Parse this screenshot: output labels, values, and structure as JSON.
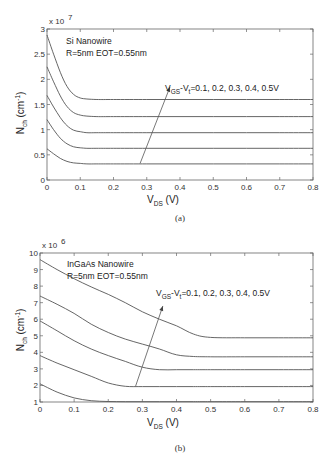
{
  "chart_data": [
    {
      "id": "a",
      "type": "line",
      "caption": "(a)",
      "annotation_title": "Si Nanowire",
      "annotation_params": "R=5nm EOT=0.55nm",
      "arrow_label_main": "V",
      "arrow_label_sub1": "GS",
      "arrow_label_mid": "-V",
      "arrow_label_sub2": "t",
      "arrow_label_tail": "=0.1, 0.2, 0.3, 0.4, 0.5V",
      "xlabel_main": "V",
      "xlabel_sub": "DS",
      "xlabel_unit": " (V)",
      "ylabel_main": "N",
      "ylabel_sub": "ch",
      "ylabel_unit": " (cm",
      "ylabel_exp": "-1",
      "ylabel_close": ")",
      "y_multiplier": "x 10",
      "y_multiplier_exp": "7",
      "xlim": [
        0,
        0.8
      ],
      "ylim": [
        0,
        3
      ],
      "xticks": [
        "0",
        "0.1",
        "0.2",
        "0.3",
        "0.4",
        "0.5",
        "0.6",
        "0.7",
        "0.8"
      ],
      "yticks": [
        "0",
        "0.5",
        "1",
        "1.5",
        "2",
        "2.5",
        "3"
      ],
      "x": [
        0,
        0.02,
        0.04,
        0.06,
        0.08,
        0.1,
        0.12,
        0.15,
        0.2,
        0.3,
        0.4,
        0.5,
        0.6,
        0.7,
        0.8
      ],
      "series": [
        {
          "name": "VGS-Vt=0.1V",
          "values": [
            0.62,
            0.52,
            0.43,
            0.37,
            0.34,
            0.33,
            0.32,
            0.32,
            0.32,
            0.32,
            0.32,
            0.32,
            0.32,
            0.32,
            0.32
          ]
        },
        {
          "name": "VGS-Vt=0.2V",
          "values": [
            1.2,
            1.0,
            0.83,
            0.72,
            0.66,
            0.64,
            0.63,
            0.63,
            0.63,
            0.63,
            0.63,
            0.63,
            0.63,
            0.63,
            0.63
          ]
        },
        {
          "name": "VGS-Vt=0.3V",
          "values": [
            1.68,
            1.45,
            1.24,
            1.08,
            0.99,
            0.96,
            0.94,
            0.94,
            0.94,
            0.94,
            0.94,
            0.94,
            0.94,
            0.94,
            0.94
          ]
        },
        {
          "name": "VGS-Vt=0.4V",
          "values": [
            2.25,
            1.95,
            1.67,
            1.46,
            1.34,
            1.29,
            1.27,
            1.26,
            1.26,
            1.26,
            1.26,
            1.26,
            1.26,
            1.26,
            1.26
          ]
        },
        {
          "name": "VGS-Vt=0.5V",
          "values": [
            2.88,
            2.5,
            2.14,
            1.86,
            1.7,
            1.63,
            1.61,
            1.6,
            1.6,
            1.6,
            1.6,
            1.6,
            1.6,
            1.6,
            1.6
          ]
        }
      ],
      "arrow": {
        "from": [
          0.28,
          0.33
        ],
        "to": [
          0.37,
          1.85
        ]
      }
    },
    {
      "id": "b",
      "type": "line",
      "caption": "(b)",
      "annotation_title": "InGaAs Nanowire",
      "annotation_params": "R=5nm EOT=0.55nm",
      "arrow_label_main": "V",
      "arrow_label_sub1": "GS",
      "arrow_label_mid": "-V",
      "arrow_label_sub2": "t",
      "arrow_label_tail": "=0.1, 0.2, 0.3, 0.4, 0.5V",
      "xlabel_main": "V",
      "xlabel_sub": "DS",
      "xlabel_unit": " (V)",
      "ylabel_main": "N",
      "ylabel_sub": "ch",
      "ylabel_unit": " (cm",
      "ylabel_exp": "-1",
      "ylabel_close": ")",
      "y_multiplier": "x 10",
      "y_multiplier_exp": "6",
      "xlim": [
        0,
        0.8
      ],
      "ylim": [
        1,
        10
      ],
      "xticks": [
        "0",
        "0.1",
        "0.2",
        "0.3",
        "0.4",
        "0.5",
        "0.6",
        "0.7",
        "0.8"
      ],
      "yticks": [
        "1",
        "2",
        "3",
        "4",
        "5",
        "6",
        "7",
        "8",
        "9",
        "10"
      ],
      "x": [
        0,
        0.05,
        0.1,
        0.15,
        0.2,
        0.25,
        0.3,
        0.35,
        0.4,
        0.45,
        0.5,
        0.6,
        0.7,
        0.8
      ],
      "series": [
        {
          "name": "VGS-Vt=0.1V",
          "values": [
            2.1,
            1.6,
            1.25,
            1.08,
            1.03,
            1.02,
            1.02,
            1.02,
            1.02,
            1.02,
            1.02,
            1.02,
            1.02,
            1.02
          ]
        },
        {
          "name": "VGS-Vt=0.2V",
          "values": [
            3.8,
            3.35,
            2.95,
            2.55,
            2.15,
            1.95,
            1.93,
            1.93,
            1.93,
            1.93,
            1.93,
            1.93,
            1.93,
            1.93
          ]
        },
        {
          "name": "VGS-Vt=0.3V",
          "values": [
            5.9,
            5.3,
            4.7,
            4.2,
            3.8,
            3.45,
            3.1,
            2.95,
            2.95,
            2.95,
            2.95,
            2.95,
            2.95,
            2.95
          ]
        },
        {
          "name": "VGS-Vt=0.4V",
          "values": [
            7.4,
            6.9,
            6.35,
            5.7,
            5.2,
            4.8,
            4.5,
            4.2,
            3.85,
            3.75,
            3.73,
            3.73,
            3.73,
            3.73
          ]
        },
        {
          "name": "VGS-Vt=0.5V",
          "values": [
            9.6,
            9.0,
            8.45,
            7.95,
            7.5,
            7.0,
            6.45,
            6.0,
            5.6,
            5.1,
            4.9,
            4.88,
            4.88,
            4.88
          ]
        }
      ],
      "arrow": {
        "from": [
          0.28,
          1.95
        ],
        "to": [
          0.36,
          6.8
        ]
      }
    }
  ]
}
